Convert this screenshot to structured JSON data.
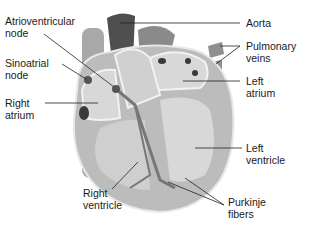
{
  "diagram": {
    "labels": {
      "atrioventricular_node": "Atrioventricular\nnode",
      "sinoatrial_node": "Sinoatrial\nnode",
      "right_atrium": "Right\natrium",
      "right_ventricle": "Right\nventricle",
      "aorta": "Aorta",
      "pulmonary_veins": "Pulmonary\nveins",
      "left_atrium": "Left\natrium",
      "left_ventricle": "Left\nventricle",
      "purkinje_fibers": "Purkinje\nfibers"
    },
    "colors": {
      "wall": "#b8b8b8",
      "chamber": "#d9d9d9",
      "vessel_dark": "#555555",
      "vessel": "#9a9a9a",
      "line": "#222222"
    }
  }
}
